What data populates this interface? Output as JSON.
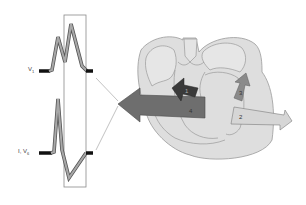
{
  "diagram": {
    "type": "heart-conduction-ecg",
    "leads": [
      {
        "id": "v1",
        "label_main": "V",
        "label_sub": "1"
      },
      {
        "id": "i-v6",
        "label_main": "I, V",
        "label_sub": "6"
      }
    ],
    "arrows": [
      {
        "number": "1",
        "color": "#3a3a3a"
      },
      {
        "number": "2",
        "color": "#d6d6d6"
      },
      {
        "number": "3",
        "color": "#8a8a8a"
      },
      {
        "number": "4",
        "color": "#6e6e6e"
      }
    ],
    "colors": {
      "heart_fill": "#dedede",
      "heart_outline": "#9a9a9a",
      "trace_fill": "#9a9a9a",
      "trace_outline": "#555555",
      "box_outline": "#8a8a8a"
    }
  }
}
